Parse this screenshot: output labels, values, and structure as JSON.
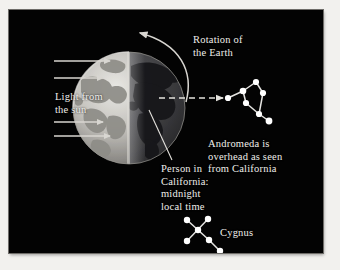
{
  "figure": {
    "type": "astronomy-diagram",
    "background_color": "#030303",
    "page_color": "#f2f1ee",
    "text_color": "#efeeea",
    "labels": {
      "sunlight": "Light from\nthe sun",
      "rotation": "Rotation of\nthe Earth",
      "person": "Person in\nCalifornia:\nmidnight\nlocal time",
      "andromeda": "Andromeda is\noverhead as seen\nfrom California",
      "cygnus": "Cygnus"
    },
    "earth": {
      "name": "earth-globe",
      "center_x": 120,
      "center_y": 98,
      "radius": 56,
      "day_side": "left",
      "night_side": "right",
      "lit_color": "#b9b7b2",
      "dark_color": "#3a3a3c",
      "terminator_x": 120
    },
    "sun_rays": {
      "name": "sunlight-arrows",
      "count": 4,
      "direction": "left-to-right",
      "color": "#d8d6d1",
      "y_positions": [
        51,
        68,
        112,
        126
      ],
      "x_start": 45,
      "x_end": 102
    },
    "rotation_arrow": {
      "name": "rotation-arc",
      "direction": "counterclockwise",
      "color": "#d8d6d1"
    },
    "sightline": {
      "name": "dashed-sightline",
      "style": "dashed",
      "color": "#e4e2dd",
      "from": "earth-night-side",
      "to": "andromeda"
    },
    "leader_line": {
      "name": "person-leader-line",
      "color": "#e4e2dd",
      "from": "earth-north-america",
      "to": "person-label"
    },
    "constellations": [
      {
        "name": "andromeda",
        "star_color": "#ffffff",
        "stars": [
          {
            "x": 219,
            "y": 88
          },
          {
            "x": 234,
            "y": 81
          },
          {
            "x": 247,
            "y": 72
          },
          {
            "x": 254,
            "y": 83
          },
          {
            "x": 237,
            "y": 93
          },
          {
            "x": 250,
            "y": 104
          },
          {
            "x": 260,
            "y": 111
          }
        ],
        "links": [
          [
            0,
            1
          ],
          [
            1,
            2
          ],
          [
            2,
            3
          ],
          [
            3,
            5
          ],
          [
            1,
            4
          ],
          [
            4,
            5
          ],
          [
            5,
            6
          ]
        ]
      },
      {
        "name": "cygnus",
        "star_color": "#ffffff",
        "stars": [
          {
            "x": 178,
            "y": 210
          },
          {
            "x": 200,
            "y": 230
          },
          {
            "x": 178,
            "y": 231
          },
          {
            "x": 199,
            "y": 209
          },
          {
            "x": 189,
            "y": 220
          },
          {
            "x": 211,
            "y": 241
          }
        ],
        "links": [
          [
            0,
            4
          ],
          [
            4,
            1
          ],
          [
            2,
            4
          ],
          [
            4,
            3
          ],
          [
            1,
            5
          ]
        ]
      }
    ]
  }
}
